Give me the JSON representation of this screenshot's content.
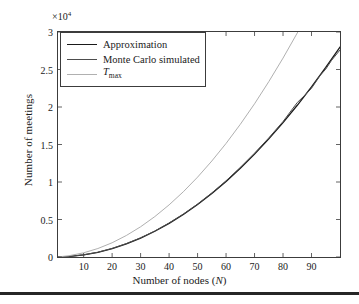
{
  "chart_data": {
    "type": "line",
    "title": "",
    "xlabel": "Number of nodes (N)",
    "xlabel_text": "Number of nodes (",
    "xlabel_var": "N",
    "xlabel_tail": ")",
    "ylabel": "Number of meetings",
    "y_exponent_label": "×10",
    "y_exponent_power": "4",
    "y_scale_factor": 10000,
    "xlim": [
      1,
      100
    ],
    "ylim": [
      0,
      30000
    ],
    "xticks": [
      10,
      20,
      30,
      40,
      50,
      60,
      70,
      80,
      90
    ],
    "xtick_labels": [
      "10",
      "20",
      "30",
      "40",
      "50",
      "60",
      "70",
      "80",
      "90"
    ],
    "yticks": [
      0,
      5000,
      10000,
      15000,
      20000,
      25000,
      30000
    ],
    "ytick_labels": [
      "0",
      "0.5",
      "1",
      "1.5",
      "2",
      "2.5",
      "3"
    ],
    "grid": false,
    "legend_position": "upper left",
    "series": [
      {
        "name": "Approximation",
        "color": "#1a1a1a",
        "width": 1.3,
        "x": [
          1,
          5,
          10,
          15,
          20,
          25,
          30,
          35,
          40,
          45,
          50,
          55,
          60,
          65,
          70,
          75,
          80,
          85,
          90,
          95,
          100
        ],
        "y": [
          3,
          70,
          280,
          630,
          1120,
          1750,
          2520,
          3430,
          4480,
          5670,
          7000,
          8470,
          10080,
          11830,
          13720,
          15750,
          17920,
          20230,
          22680,
          25270,
          28000
        ]
      },
      {
        "name": "Monte Carlo simulated",
        "color": "#4d4d4d",
        "width": 1.0,
        "x": [
          1,
          5,
          10,
          15,
          20,
          25,
          30,
          35,
          40,
          45,
          50,
          55,
          60,
          65,
          70,
          75,
          80,
          85,
          88,
          90,
          93,
          95,
          97,
          100
        ],
        "y": [
          4,
          75,
          290,
          640,
          1140,
          1790,
          2560,
          3470,
          4530,
          5730,
          7060,
          8540,
          10160,
          11940,
          13850,
          15880,
          18060,
          20600,
          21700,
          22500,
          24200,
          25050,
          26200,
          27600
        ]
      },
      {
        "name": "T_max",
        "name_var": "T",
        "name_sub": "max",
        "color": "#b0b0b0",
        "width": 1.0,
        "x": [
          1,
          5,
          10,
          15,
          20,
          25,
          30,
          35,
          40,
          45,
          50,
          55,
          60,
          65,
          70,
          75,
          80,
          85,
          86
        ],
        "y": [
          10,
          180,
          560,
          1130,
          1900,
          2870,
          4030,
          5390,
          6950,
          8700,
          10650,
          12800,
          15140,
          17690,
          20430,
          23380,
          26520,
          29870,
          30580
        ]
      }
    ]
  },
  "legend": {
    "items": [
      {
        "label": "Approximation",
        "color": "#1a1a1a"
      },
      {
        "label": "Monte Carlo simulated",
        "color": "#4d4d4d"
      },
      {
        "label": "T_max",
        "color": "#b0b0b0"
      }
    ]
  }
}
